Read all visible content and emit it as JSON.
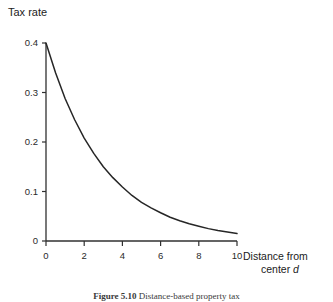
{
  "figure": {
    "title": "Tax rate",
    "x_axis_label_line1": "Distance from",
    "x_axis_label_line2_prefix": "center ",
    "x_axis_label_variable": "d",
    "caption_label": "Figure 5.10",
    "caption_text": "Distance-based property tax"
  },
  "chart_data": {
    "type": "line",
    "title": "Tax rate",
    "xlabel": "Distance from center d",
    "ylabel": "Tax rate",
    "xlim": [
      0,
      10
    ],
    "ylim": [
      0,
      0.4
    ],
    "grid": false,
    "legend": "none",
    "x_ticks": [
      "0",
      "2",
      "4",
      "6",
      "8",
      "10"
    ],
    "x_tick_values": [
      0,
      2,
      4,
      6,
      8,
      10
    ],
    "y_ticks": [
      "0",
      "0.1",
      "0.2",
      "0.3",
      "0.4"
    ],
    "y_tick_values": [
      0,
      0.1,
      0.2,
      0.3,
      0.4
    ],
    "series": [
      {
        "name": "Tax rate",
        "color": "#262626",
        "x": [
          0,
          0.5,
          1,
          1.5,
          2,
          2.5,
          3,
          3.5,
          4,
          4.5,
          5,
          5.5,
          6,
          6.5,
          7,
          7.5,
          8,
          8.5,
          9,
          9.5,
          10
        ],
        "values": [
          0.4,
          0.34,
          0.288,
          0.245,
          0.208,
          0.177,
          0.15,
          0.128,
          0.109,
          0.092,
          0.078,
          0.067,
          0.057,
          0.048,
          0.041,
          0.035,
          0.03,
          0.025,
          0.021,
          0.018,
          0.015
        ]
      }
    ]
  }
}
